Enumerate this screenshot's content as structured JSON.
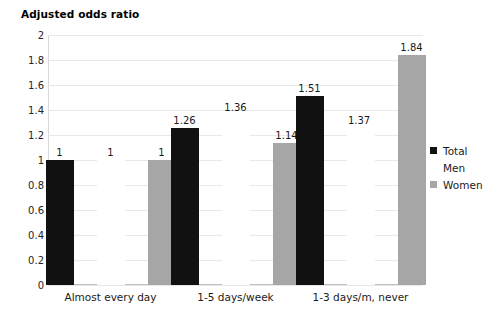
{
  "chart_data": {
    "type": "bar",
    "title": "Adjusted odds ratio",
    "xlabel": "",
    "ylabel": "",
    "ylim": [
      0,
      2
    ],
    "ytick_step": 0.2,
    "grid": true,
    "legend_position": "right",
    "categories": [
      "Almost every day",
      "1-5 days/week",
      "1-3 days/m, never"
    ],
    "ytick_labels": [
      "2",
      "1.8",
      "1.6",
      "1.4",
      "1.2",
      "1",
      "0.8",
      "0.6",
      "0.4",
      "0.2",
      "0"
    ],
    "ytick_values": [
      2,
      1.8,
      1.6,
      1.4,
      1.2,
      1,
      0.8,
      0.6,
      0.4,
      0.2,
      0
    ],
    "series": [
      {
        "name": "Total",
        "color": "#111111",
        "values": [
          1,
          1.26,
          1.51
        ],
        "labels": [
          "1",
          "1.26",
          "1.51"
        ]
      },
      {
        "name": "Men",
        "color": "#ffffff",
        "values": [
          1,
          1.36,
          1.37
        ],
        "labels": [
          "1",
          "1.36",
          "1.37"
        ]
      },
      {
        "name": "Women",
        "color": "#a6a6a6",
        "values": [
          1,
          1.14,
          1.84
        ],
        "labels": [
          "1",
          "1.14",
          "1.84"
        ]
      }
    ]
  },
  "legend": {
    "items": [
      {
        "label": "Total",
        "color": "#111111"
      },
      {
        "label": "Men",
        "color": "#ffffff"
      },
      {
        "label": "Women",
        "color": "#a6a6a6"
      }
    ]
  }
}
